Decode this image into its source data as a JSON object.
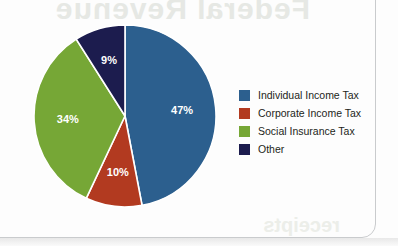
{
  "chart_data": {
    "type": "pie",
    "title": "",
    "categories": [
      "Individual Income Tax",
      "Corporate Income Tax",
      "Social Insurance Tax",
      "Other"
    ],
    "values": [
      47,
      10,
      34,
      9
    ],
    "value_labels": [
      "47%",
      "10%",
      "34%",
      "9%"
    ],
    "colors": [
      "#2c5f8e",
      "#b23a20",
      "#76a736",
      "#1c1c4e"
    ],
    "units": "percent",
    "start_angle_deg": 0,
    "direction": "clockwise",
    "legend_position": "right",
    "grid": false,
    "slice_divider_color": "#ffffff",
    "slice_label_color": "#ffffff"
  },
  "legend": {
    "items": [
      {
        "label": "Individual Income Tax",
        "color": "#2c5f8e"
      },
      {
        "label": "Corporate Income Tax",
        "color": "#b23a20"
      },
      {
        "label": "Social Insurance Tax",
        "color": "#76a736"
      },
      {
        "label": "Other",
        "color": "#1c1c4e"
      }
    ]
  },
  "card": {
    "border_color": "#c9cbcd"
  }
}
